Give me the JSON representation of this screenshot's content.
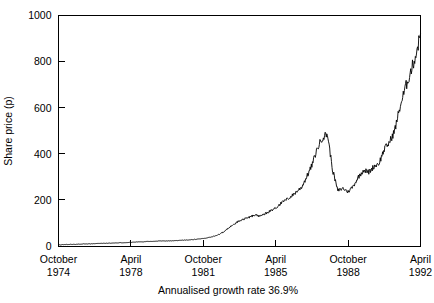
{
  "chart_data": {
    "type": "line",
    "title": "",
    "subtitle": "",
    "caption": "Annualised growth rate 36.9%",
    "xlabel": "",
    "ylabel": "Share price (p)",
    "ylim": [
      0,
      1000
    ],
    "xlim": [
      1974.75,
      1992.25
    ],
    "ytick_labels": [
      "0",
      "200",
      "400",
      "600",
      "800",
      "1000"
    ],
    "ytick_values": [
      0,
      200,
      400,
      600,
      800,
      1000
    ],
    "xtick_values": [
      1974.75,
      1978.25,
      1981.75,
      1985.25,
      1988.75,
      1992.25
    ],
    "xtick_labels": [
      {
        "month": "October",
        "year": "1974"
      },
      {
        "month": "April",
        "year": "1978"
      },
      {
        "month": "October",
        "year": "1981"
      },
      {
        "month": "April",
        "year": "1985"
      },
      {
        "month": "October",
        "year": "1988"
      },
      {
        "month": "April",
        "year": "1992"
      }
    ],
    "grid": false,
    "legend": false,
    "legend_position": "none",
    "line_color": "#000000",
    "series": [
      {
        "name": "Share price",
        "x": [
          1974.75,
          1975.0,
          1975.25,
          1975.5,
          1975.75,
          1976.0,
          1976.25,
          1976.5,
          1976.75,
          1977.0,
          1977.25,
          1977.5,
          1977.75,
          1978.0,
          1978.25,
          1978.5,
          1978.75,
          1979.0,
          1979.25,
          1979.5,
          1979.75,
          1980.0,
          1980.25,
          1980.5,
          1980.75,
          1981.0,
          1981.25,
          1981.5,
          1981.75,
          1982.0,
          1982.25,
          1982.5,
          1982.75,
          1983.0,
          1983.25,
          1983.5,
          1983.75,
          1984.0,
          1984.25,
          1984.5,
          1984.75,
          1985.0,
          1985.25,
          1985.5,
          1985.75,
          1986.0,
          1986.25,
          1986.5,
          1986.75,
          1987.0,
          1987.25,
          1987.5,
          1987.75,
          1988.0,
          1988.25,
          1988.5,
          1988.75,
          1989.0,
          1989.25,
          1989.5,
          1989.75,
          1990.0,
          1990.25,
          1990.5,
          1990.75,
          1991.0,
          1991.25,
          1991.5,
          1991.75,
          1992.0,
          1992.25
        ],
        "values": [
          5,
          6,
          7,
          7,
          8,
          9,
          9,
          10,
          11,
          12,
          12,
          13,
          14,
          15,
          16,
          17,
          18,
          19,
          20,
          21,
          22,
          22,
          23,
          24,
          25,
          26,
          28,
          30,
          32,
          36,
          42,
          50,
          62,
          80,
          95,
          110,
          118,
          125,
          135,
          128,
          140,
          152,
          165,
          185,
          200,
          215,
          235,
          255,
          300,
          350,
          420,
          470,
          487,
          330,
          240,
          250,
          235,
          260,
          300,
          330,
          320,
          345,
          360,
          420,
          450,
          500,
          600,
          680,
          750,
          820,
          920
        ]
      }
    ]
  },
  "axis": {
    "y_title": "Share price (p)"
  },
  "caption": {
    "text": "Annualised growth rate 36.9%"
  }
}
